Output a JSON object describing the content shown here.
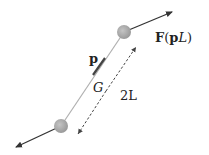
{
  "diagram": {
    "labels": {
      "momentum": "p",
      "center": "G",
      "length": "2L",
      "force_bold": "F",
      "force_arg_open": "(",
      "force_arg_p": "p",
      "force_arg_L": "L",
      "force_arg_close": ")"
    },
    "colors": {
      "rod": "#aaaaaa",
      "ball": "#a8a8a8",
      "arrow": "#333333",
      "dashed": "#444444"
    }
  }
}
